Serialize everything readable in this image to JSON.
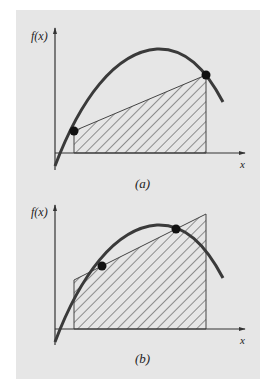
{
  "figure": {
    "background_color": "#e6e6e6",
    "curve_color": "#3a3a3a",
    "point_color": "#111111",
    "hatch_color": "#333333",
    "panels": [
      {
        "id": "a",
        "y_axis_label": "f(x)",
        "x_axis_label": "x",
        "caption": "(a)",
        "description": "Trapezoid under chord connecting two points on curve"
      },
      {
        "id": "b",
        "y_axis_label": "f(x)",
        "x_axis_label": "x",
        "caption": "(b)",
        "description": "Trapezoid under line through two interior points on curve (Gauss quadrature)"
      }
    ]
  }
}
